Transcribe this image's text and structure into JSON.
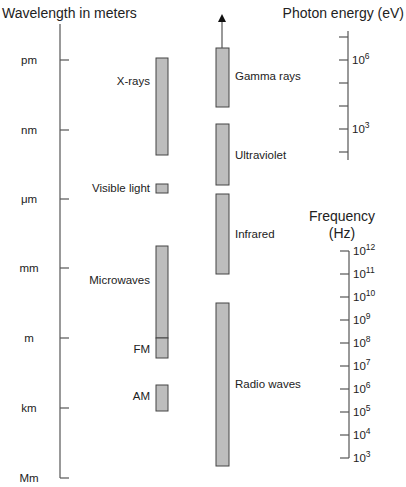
{
  "colors": {
    "bar_fill": "#bdbdbd",
    "bar_stroke": "#444444",
    "axis": "#555555",
    "text": "#222222"
  },
  "wavelength_axis": {
    "title": "Wavelength in meters",
    "ticks": [
      {
        "label": "pm",
        "y": 60
      },
      {
        "label": "nm",
        "y": 130
      },
      {
        "label": "μm",
        "y": 199
      },
      {
        "label": "mm",
        "y": 268
      },
      {
        "label": "m",
        "y": 338
      },
      {
        "label": "km",
        "y": 408
      },
      {
        "label": "Mm",
        "y": 478
      }
    ]
  },
  "photon_energy_axis": {
    "title": "Photon energy (eV)",
    "ticks": [
      {
        "label": "",
        "y": 37
      },
      {
        "label": "10",
        "sup": "6",
        "y": 60
      },
      {
        "label": "",
        "y": 83
      },
      {
        "label": "",
        "y": 106
      },
      {
        "label": "10",
        "sup": "3",
        "y": 129
      },
      {
        "label": "",
        "y": 152
      }
    ]
  },
  "frequency_axis": {
    "title_line1": "Frequency",
    "title_line2": "(Hz)",
    "ticks": [
      {
        "label": "10",
        "sup": "12",
        "y": 251
      },
      {
        "label": "10",
        "sup": "11",
        "y": 274
      },
      {
        "label": "10",
        "sup": "10",
        "y": 297
      },
      {
        "label": "10",
        "sup": "9",
        "y": 320
      },
      {
        "label": "10",
        "sup": "8",
        "y": 343
      },
      {
        "label": "10",
        "sup": "7",
        "y": 366
      },
      {
        "label": "10",
        "sup": "6",
        "y": 389
      },
      {
        "label": "10",
        "sup": "5",
        "y": 412
      },
      {
        "label": "10",
        "sup": "4",
        "y": 435
      },
      {
        "label": "10",
        "sup": "3",
        "y": 458
      }
    ]
  },
  "left_bands": [
    {
      "name": "X-rays",
      "label": "X-rays",
      "y1": 58,
      "y2": 155,
      "label_y": 85
    },
    {
      "name": "Visible light",
      "label": "Visible light",
      "y1": 184,
      "y2": 193,
      "label_y": 192
    },
    {
      "name": "Microwaves",
      "label": "Microwaves",
      "y1": 246,
      "y2": 338,
      "label_y": 284
    },
    {
      "name": "FM",
      "label": "FM",
      "y1": 338,
      "y2": 358,
      "label_y": 353
    },
    {
      "name": "AM",
      "label": "AM",
      "y1": 385,
      "y2": 411,
      "label_y": 400
    }
  ],
  "right_bands": [
    {
      "name": "Gamma rays",
      "label": "Gamma rays",
      "y1": 48,
      "y2": 107,
      "label_y": 80
    },
    {
      "name": "Ultraviolet",
      "label": "Ultraviolet",
      "y1": 124,
      "y2": 185,
      "label_y": 159
    },
    {
      "name": "Infrared",
      "label": "Infrared",
      "y1": 194,
      "y2": 274,
      "label_y": 238
    },
    {
      "name": "Radio waves",
      "label": "Radio waves",
      "y1": 303,
      "y2": 466,
      "label_y": 388
    }
  ],
  "gamma_arrow": {
    "x": 222,
    "y_top": 14,
    "y_bottom": 48
  }
}
